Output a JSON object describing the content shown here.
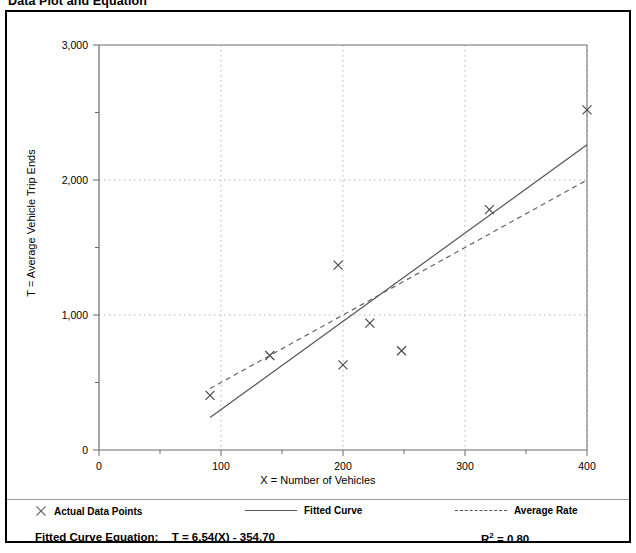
{
  "title": "Data Plot and Equation",
  "axes": {
    "x_title": "X = Number of Vehicles",
    "y_title": "T = Average Vehicle Trip Ends"
  },
  "legend": {
    "points_label": "Actual Data Points",
    "fitted_label": "Fitted Curve",
    "average_label": "Average Rate",
    "point_marker": "x-marker-icon",
    "fitted_marker": "solid-line-icon",
    "average_marker": "dashed-line-icon"
  },
  "equation": {
    "label": "Fitted Curve Equation:",
    "formula": "T = 6.54(X) - 354.70",
    "r2_prefix": "R",
    "r2_sup": "2",
    "r2_value": "= 0.80"
  },
  "colors": {
    "frame": "#000000",
    "axis": "#6b6b6b",
    "grid": "#b5b5b5",
    "marker": "#4a4a4a",
    "fitted_line": "#555555",
    "average_line": "#666666"
  },
  "chart_data": {
    "type": "scatter",
    "title": "Data Plot and Equation",
    "xlabel": "X = Number of Vehicles",
    "ylabel": "T = Average Vehicle Trip Ends",
    "xlim": [
      0,
      400
    ],
    "ylim": [
      0,
      3000
    ],
    "xticks": [
      0,
      100,
      200,
      300,
      400
    ],
    "xticks_minor_step": 50,
    "yticks": [
      0,
      1000,
      2000,
      3000
    ],
    "yticks_minor_step": 500,
    "ytick_labels": [
      "0",
      "1,000",
      "2,000",
      "3,000"
    ],
    "xtick_labels": [
      "0",
      "100",
      "200",
      "300",
      "400"
    ],
    "grid": true,
    "grid_style": "dotted",
    "legend_position": "below-plot",
    "series": [
      {
        "name": "Actual Data Points",
        "type": "scatter",
        "marker": "x",
        "points": [
          {
            "x": 91,
            "y": 405
          },
          {
            "x": 140,
            "y": 700
          },
          {
            "x": 196,
            "y": 1370
          },
          {
            "x": 200,
            "y": 630
          },
          {
            "x": 222,
            "y": 940
          },
          {
            "x": 248,
            "y": 735
          },
          {
            "x": 320,
            "y": 1780
          },
          {
            "x": 400,
            "y": 2520
          }
        ]
      },
      {
        "name": "Fitted Curve",
        "type": "line",
        "style": "solid",
        "equation": "T = 6.54(X) - 354.70",
        "slope": 6.54,
        "intercept": -354.7,
        "r_squared": 0.8,
        "endpoints": [
          {
            "x": 91,
            "y": 240
          },
          {
            "x": 400,
            "y": 2261
          }
        ]
      },
      {
        "name": "Average Rate",
        "type": "line",
        "style": "dashed",
        "slope": 5.0,
        "intercept": 0,
        "endpoints": [
          {
            "x": 91,
            "y": 455
          },
          {
            "x": 400,
            "y": 2000
          }
        ]
      }
    ]
  }
}
